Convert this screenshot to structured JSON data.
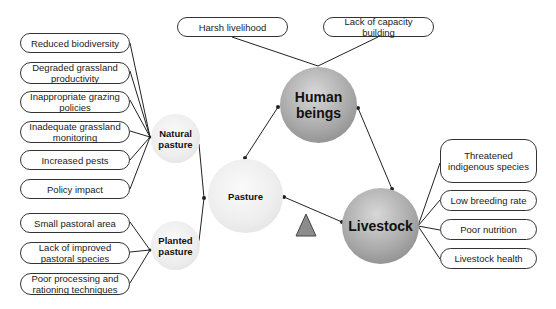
{
  "diagram": {
    "colors": {
      "line": "#222222",
      "light_node": "#eeeeee",
      "dark_node": "#a0a0a0",
      "triangle": "#8c8c8c"
    },
    "central_nodes": {
      "human_beings": {
        "label_line1": "Human",
        "label_line2": "beings"
      },
      "pasture": {
        "label": "Pasture"
      },
      "livestock": {
        "label": "Livestock"
      }
    },
    "sub_nodes": {
      "natural_pasture": {
        "label_line1": "Natural",
        "label_line2": "pasture"
      },
      "planted_pasture": {
        "label_line1": "Planted",
        "label_line2": "pasture"
      }
    },
    "human_factors": [
      {
        "label": "Harsh livelihood"
      },
      {
        "label": "Lack of capacity building"
      }
    ],
    "natural_pasture_factors": [
      {
        "label": "Reduced biodiversity"
      },
      {
        "label": "Degraded grassland productivity"
      },
      {
        "label": "Inappropriate grazing policies"
      },
      {
        "label": "Inadequate grassland monitoring"
      },
      {
        "label": "Increased pests"
      },
      {
        "label": "Policy impact"
      }
    ],
    "planted_pasture_factors": [
      {
        "label": "Small pastoral area"
      },
      {
        "label": "Lack of improved pastoral species"
      },
      {
        "label": "Poor processing and rationing techniques"
      }
    ],
    "livestock_factors": [
      {
        "label": "Threatened indigenous species"
      },
      {
        "label": "Low breeding rate"
      },
      {
        "label": "Poor nutrition"
      },
      {
        "label": "Livestock health"
      }
    ],
    "triangle_icon": "triangle-marker"
  }
}
